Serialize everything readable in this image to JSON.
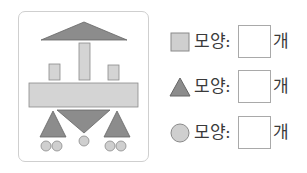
{
  "figure": {
    "colors": {
      "rect_fill": "#d4d4d4",
      "rect_stroke": "#8a8a8a",
      "triangle_fill": "#8c8c8c",
      "triangle_stroke": "#666666",
      "circle_fill": "#cfcfcf",
      "circle_stroke": "#8a8a8a",
      "panel_border": "#cfcfcf"
    },
    "counts_visible": {
      "rectangles": 4,
      "triangles": 4,
      "circles": 5
    }
  },
  "questions": [
    {
      "shape": "square-icon",
      "label": "모양:",
      "answer": "",
      "unit": "개"
    },
    {
      "shape": "triangle-icon",
      "label": "모양:",
      "answer": "",
      "unit": "개"
    },
    {
      "shape": "circle-icon",
      "label": "모양:",
      "answer": "",
      "unit": "개"
    }
  ]
}
